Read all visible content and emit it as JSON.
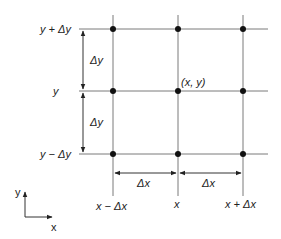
{
  "diagram": {
    "type": "finite-difference-grid",
    "colors": {
      "line": "#7a7a7a",
      "node": "#111111",
      "arrow": "#333333",
      "text": "#222222"
    },
    "row_labels": [
      "y + Δy",
      "y",
      "y − Δy"
    ],
    "column_labels": [
      "x − Δx",
      "x",
      "x + Δx"
    ],
    "center_node_label": "(x, y)",
    "spacing_labels": {
      "dy_upper": "Δy",
      "dy_lower": "Δy",
      "dx_left": "Δx",
      "dx_right": "Δx"
    },
    "axes": {
      "x_label": "x",
      "y_label": "y"
    }
  }
}
